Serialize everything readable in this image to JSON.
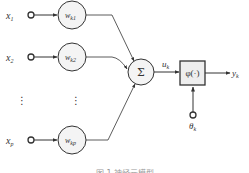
{
  "diagram": {
    "type": "neuron-model",
    "inputs": [
      {
        "label": "x",
        "sub": "1",
        "weight": "w",
        "weight_sub": "k1"
      },
      {
        "label": "x",
        "sub": "2",
        "weight": "w",
        "weight_sub": "k2"
      },
      {
        "label": "x",
        "sub": "p",
        "weight": "w",
        "weight_sub": "kp"
      }
    ],
    "ellipsis": "⋮",
    "summation": "Σ",
    "net_input": {
      "label": "u",
      "sub": "k"
    },
    "activation": "φ(·)",
    "threshold": {
      "label": "θ",
      "sub": "k"
    },
    "output": {
      "label": "y",
      "sub": "k"
    },
    "caption": "图 1  神经元模型"
  },
  "colors": {
    "stroke": "#333333",
    "node_fill": "#f4f4f4",
    "box_fill": "#eeeeee"
  }
}
